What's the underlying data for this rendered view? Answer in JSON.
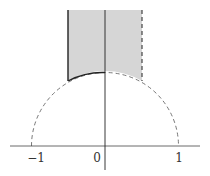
{
  "diagram": {
    "tick_labels": {
      "neg_one": "−1",
      "zero": "0",
      "one": "1"
    },
    "colors": {
      "shade": "#d6d6d6",
      "line": "#222222",
      "dashed": "#555555"
    }
  }
}
